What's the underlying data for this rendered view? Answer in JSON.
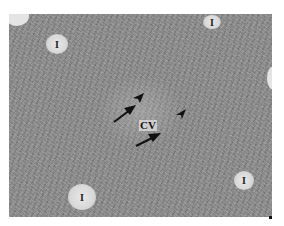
{
  "figure": {
    "type": "histology micrograph",
    "central_label": "CV",
    "vessel_label": "I",
    "vessels": [
      {
        "id": "top-left",
        "label": "I"
      },
      {
        "id": "top-center-right",
        "label": "I"
      },
      {
        "id": "bottom-left",
        "label": "I"
      },
      {
        "id": "bottom-right",
        "label": "I"
      }
    ],
    "annotations": {
      "arrows": 2,
      "arrowheads": 2
    }
  }
}
